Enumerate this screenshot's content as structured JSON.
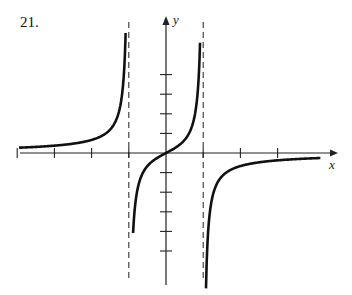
{
  "problem_number": "21.",
  "chart_data": {
    "type": "line",
    "title": "",
    "xlabel": "x",
    "ylabel": "y",
    "grid": false,
    "legend": null,
    "vertical_asymptotes": [
      -1,
      1
    ],
    "horizontal_asymptote": 0,
    "x_ticks": [
      -4,
      -3,
      -2,
      -1,
      1,
      2,
      3
    ],
    "y_ticks": [
      -5,
      -4,
      -3,
      -2,
      -1,
      1,
      2,
      3,
      4
    ],
    "xlim": [
      -4.0,
      4.6
    ],
    "ylim": [
      -6.9,
      7.0
    ],
    "series": [
      {
        "name": "left branch (x < -1)",
        "points": [
          [
            -3.9,
            -0.27
          ],
          [
            -3,
            -0.38
          ],
          [
            -2,
            -0.67
          ],
          [
            -1.5,
            -1.2
          ],
          [
            -1.2,
            -2.7
          ],
          [
            -1.1,
            -4.8
          ],
          [
            -1.08,
            -5.4
          ]
        ]
      },
      {
        "name": "middle branch (-1 < x < 1)",
        "points": [
          [
            -0.88,
            5.5
          ],
          [
            -0.8,
            2.2
          ],
          [
            -0.5,
            0.67
          ],
          [
            0,
            0
          ],
          [
            0.5,
            -0.67
          ],
          [
            0.8,
            -2.2
          ],
          [
            0.92,
            -5.6
          ]
        ]
      },
      {
        "name": "right branch (x > 1)",
        "points": [
          [
            1.08,
            5.9
          ],
          [
            1.2,
            2.7
          ],
          [
            1.5,
            1.2
          ],
          [
            2,
            0.67
          ],
          [
            3,
            0.38
          ],
          [
            4.1,
            0.26
          ]
        ]
      }
    ]
  },
  "axes": {
    "x_label": "x",
    "y_label": "y"
  }
}
